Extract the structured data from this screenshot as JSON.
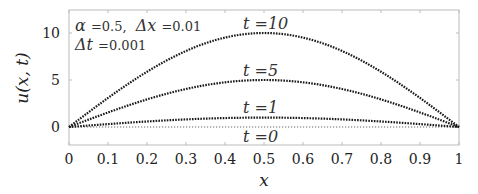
{
  "chart_data": {
    "type": "line",
    "title": "",
    "xlabel": "x",
    "ylabel": "u(x,t)",
    "xlim": [
      0,
      1
    ],
    "ylim": [
      -2,
      12
    ],
    "xticks": [
      "0",
      "0.1",
      "0.2",
      "0.3",
      "0.4",
      "0.5",
      "0.6",
      "0.7",
      "0.8",
      "0.9",
      "1"
    ],
    "yticks": [
      "0",
      "5",
      "10"
    ],
    "grid": false,
    "legend": null,
    "annotations": [
      "α = 0.5, Δx = 0.01",
      "Δt = 0.001",
      "t = 10",
      "t = 5",
      "t = 1",
      "t = 0"
    ],
    "x": [
      0,
      0.1,
      0.2,
      0.3,
      0.4,
      0.5,
      0.6,
      0.7,
      0.8,
      0.9,
      1
    ],
    "series": [
      {
        "name": "t = 0",
        "style": "dotted gray",
        "values": [
          0,
          0,
          0,
          0,
          0,
          0,
          0,
          0,
          0,
          0,
          0
        ]
      },
      {
        "name": "t = 1",
        "style": "dotted dark",
        "values": [
          0,
          0.31,
          0.59,
          0.81,
          0.95,
          1.0,
          0.95,
          0.81,
          0.59,
          0.31,
          0
        ]
      },
      {
        "name": "t = 5",
        "style": "dotted dark",
        "values": [
          0,
          1.55,
          2.94,
          4.05,
          4.76,
          5.0,
          4.76,
          4.05,
          2.94,
          1.55,
          0
        ]
      },
      {
        "name": "t = 10",
        "style": "dotted dark",
        "values": [
          0,
          3.09,
          5.88,
          8.09,
          9.51,
          10.0,
          9.51,
          8.09,
          5.88,
          3.09,
          0
        ]
      }
    ]
  },
  "labels": {
    "ylabel": "u(x, t)",
    "xlabel": "x",
    "param_line1_alpha": "α",
    "param_line1_alpha_val": "=0.5,",
    "param_line1_dx": "Δx",
    "param_line1_dx_val": "=0.01",
    "param_line2_dt": "Δt",
    "param_line2_dt_val": "=0.001",
    "t10": "t =10",
    "t5": "t =5",
    "t1": "t =1",
    "t0": "t =0"
  }
}
